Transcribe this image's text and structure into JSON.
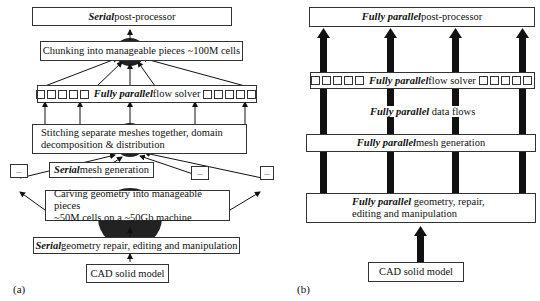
{
  "panel_a": {
    "label": "(a)",
    "post_processor": {
      "emph": "Serial",
      "rest": " post-processor"
    },
    "chunking": "Chunking into manageable pieces ~100M cells",
    "flow_solver": {
      "emph": "Fully parallel",
      "rest": " flow solver"
    },
    "stitching": [
      "Stitching separate meshes together, domain",
      "decomposition & distribution"
    ],
    "mesh_generation": {
      "emph": "Serial",
      "rest": " mesh generation"
    },
    "ellipsis": "...",
    "carving": [
      "Carving geometry into manageable pieces",
      "~50M cells on a ~50Gb machine"
    ],
    "geometry_repair": {
      "emph": "Serial",
      "rest": " geometry repair, editing and manipulation"
    },
    "cad": "CAD solid model"
  },
  "panel_b": {
    "label": "(b)",
    "post_processor": {
      "emph": "Fully parallel",
      "rest": " post-processor"
    },
    "flow_solver": {
      "emph": "Fully parallel",
      "rest": " flow solver"
    },
    "data_flows": {
      "emph": "Fully parallel",
      "rest": " data flows"
    },
    "mesh_generation": {
      "emph": "Fully parallel",
      "rest": " mesh generation"
    },
    "geometry": {
      "emph": "Fully parallel",
      "rest": " geometry, repair,",
      "line2": "editing and manipulation"
    },
    "cad": "CAD solid model"
  }
}
